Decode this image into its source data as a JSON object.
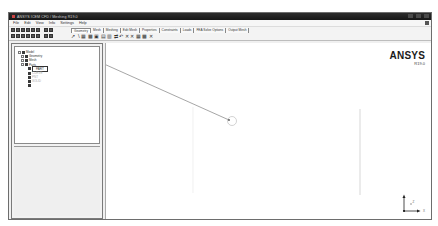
{
  "window": {
    "title": "ANSYS ICEM CFD / Meshing R19.0",
    "controls": [
      "minimize",
      "maximize",
      "close"
    ]
  },
  "menu": {
    "items": [
      "File",
      "Edit",
      "View",
      "Info",
      "Settings",
      "Help"
    ]
  },
  "toolbar": {
    "row1_icon_count": 8,
    "row2_icon_count": 8,
    "tabs": [
      {
        "label": "Geometry",
        "active": true
      },
      {
        "label": "Mesh",
        "active": false
      },
      {
        "label": "Meshing",
        "active": false
      },
      {
        "label": "Edit Mesh",
        "active": false
      },
      {
        "label": "Properties",
        "active": false
      },
      {
        "label": "Constraints",
        "active": false
      },
      {
        "label": "Loads",
        "active": false
      },
      {
        "label": "FEA Solve Options",
        "active": false
      },
      {
        "label": "Output Mesh",
        "active": false
      }
    ],
    "geometry_tools": [
      {
        "name": "create-point-icon",
        "glyph": "↗"
      },
      {
        "name": "create-curve-icon",
        "glyph": "∖"
      },
      {
        "name": "create-surface-icon",
        "glyph": "▦"
      },
      {
        "name": "create-body-icon",
        "glyph": "▩"
      },
      {
        "name": "repair-geometry-icon",
        "glyph": "▣"
      },
      {
        "name": "geometry-tool-icon",
        "glyph": "▤"
      },
      {
        "name": "faceting-icon",
        "glyph": "▥"
      },
      {
        "name": "transform-icon",
        "glyph": "⇄"
      },
      {
        "name": "restore-icon",
        "glyph": "↶"
      },
      {
        "name": "delete-point-icon",
        "glyph": "✕"
      },
      {
        "name": "delete-curve-icon",
        "glyph": "✕"
      },
      {
        "name": "delete-surface-icon",
        "glyph": "▦"
      },
      {
        "name": "delete-body-icon",
        "glyph": "▩"
      },
      {
        "name": "delete-any-icon",
        "glyph": "✕"
      }
    ]
  },
  "tree": {
    "items": [
      {
        "label": "Model",
        "level": 0
      },
      {
        "label": "Geometry",
        "level": 1
      },
      {
        "label": "Mesh",
        "level": 1
      },
      {
        "label": "Parts",
        "level": 1
      },
      {
        "label": "PART",
        "level": 2,
        "selected": true
      },
      {
        "label": "CURVE",
        "level": 2,
        "faded": true
      },
      {
        "label": "PNT",
        "level": 2,
        "faded": true
      },
      {
        "label": "SOLID",
        "level": 2,
        "faded": true
      },
      {
        "label": "",
        "level": 2
      }
    ]
  },
  "viewport": {
    "logo": "ANSYS",
    "release": "R19.0",
    "axis_labels": {
      "x": "X",
      "y": "Y",
      "z": "Z"
    }
  }
}
